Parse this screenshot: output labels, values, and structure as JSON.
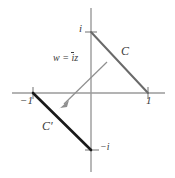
{
  "figure": {
    "colors": {
      "axis": "#9a9a9a",
      "curve_c": "#6a6a6a",
      "curve_c_prime": "#1a1a1a",
      "arrow": "#8f8f8f",
      "text": "#3a3a3a",
      "background": "#ffffff"
    },
    "axes": {
      "real_axis_label": "",
      "imaginary_axis_label": "",
      "origin": {
        "x": 91,
        "y": 93
      }
    },
    "labels": {
      "point_i": "i",
      "point_neg_i": "−i",
      "point_neg_one": "−1",
      "point_one": "1",
      "curve_c": "C",
      "curve_c_prime": "C′",
      "mapping_w": "w",
      "mapping_eq": "=",
      "mapping_ibar": "i",
      "mapping_z": "z"
    },
    "segments": {
      "c": {
        "from": "i",
        "to": "1"
      },
      "c_prime": {
        "from": "−1",
        "to": "−i"
      }
    }
  }
}
